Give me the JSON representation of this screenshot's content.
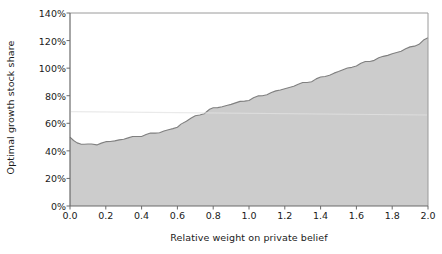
{
  "chart_data": {
    "type": "area",
    "title": "",
    "xlabel": "Relative weight on private belief",
    "ylabel": "Optimal growth stock share",
    "xlim": [
      0.0,
      2.0
    ],
    "ylim": [
      0.0,
      1.4
    ],
    "grid": false,
    "legend": null,
    "x_tick_labels": [
      "0.0",
      "0.2",
      "0.4",
      "0.6",
      "0.8",
      "1.0",
      "1.2",
      "1.4",
      "1.6",
      "1.8",
      "2.0"
    ],
    "x_tick_values": [
      0.0,
      0.2,
      0.4,
      0.6,
      0.8,
      1.0,
      1.2,
      1.4,
      1.6,
      1.8,
      2.0
    ],
    "y_tick_labels": [
      "0%",
      "20%",
      "40%",
      "60%",
      "80%",
      "100%",
      "120%",
      "140%"
    ],
    "y_tick_values": [
      0.0,
      0.2,
      0.4,
      0.6,
      0.8,
      1.0,
      1.2,
      1.4
    ],
    "series": [
      {
        "name": "Optimal growth stock share",
        "fill_color": "#cccccc",
        "line_color": "#808080",
        "x": [
          0.0,
          0.02,
          0.04,
          0.06,
          0.08,
          0.1,
          0.12,
          0.15,
          0.2,
          0.25,
          0.3,
          0.35,
          0.4,
          0.45,
          0.5,
          0.55,
          0.6,
          0.62,
          0.65,
          0.7,
          0.75,
          0.78,
          0.8,
          0.85,
          0.9,
          0.95,
          1.0,
          1.05,
          1.1,
          1.15,
          1.2,
          1.25,
          1.3,
          1.35,
          1.4,
          1.45,
          1.5,
          1.55,
          1.6,
          1.65,
          1.7,
          1.75,
          1.8,
          1.85,
          1.9,
          1.95,
          2.0
        ],
        "y": [
          0.5,
          0.475,
          0.458,
          0.449,
          0.444,
          0.443,
          0.445,
          0.45,
          0.462,
          0.474,
          0.487,
          0.499,
          0.511,
          0.523,
          0.536,
          0.551,
          0.57,
          0.59,
          0.62,
          0.648,
          0.676,
          0.695,
          0.707,
          0.722,
          0.738,
          0.755,
          0.772,
          0.792,
          0.812,
          0.832,
          0.85,
          0.872,
          0.89,
          0.908,
          0.93,
          0.952,
          0.975,
          0.998,
          1.02,
          1.042,
          1.062,
          1.082,
          1.105,
          1.125,
          1.15,
          1.178,
          1.22
        ]
      }
    ]
  },
  "plot": {
    "left_px": 70,
    "right_px": 428,
    "bottom_px": 206,
    "top_px": 13,
    "border_color": "#9a9a9a",
    "axis_color": "#6b6b6b",
    "background": "#ffffff"
  }
}
